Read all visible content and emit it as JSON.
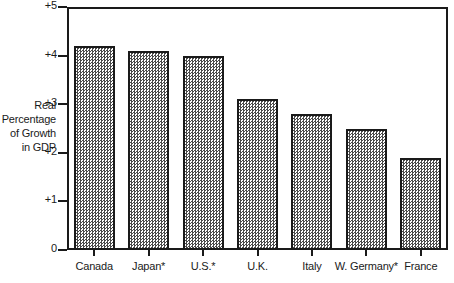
{
  "chart_data": {
    "type": "bar",
    "title": "",
    "subtitle": "",
    "xlabel": "",
    "ylabel": "Real Percentage of Growth in GDP",
    "ylabel_lines": [
      "Real",
      "Percentage",
      "of Growth",
      "in GDP"
    ],
    "categories": [
      "Canada",
      "Japan*",
      "U.S.*",
      "U.K.",
      "Italy",
      "W. Germany*",
      "France"
    ],
    "values": [
      4.2,
      4.1,
      4.0,
      3.1,
      2.8,
      2.5,
      1.9
    ],
    "ylim": [
      0,
      5
    ],
    "ytick_values": [
      0,
      1,
      2,
      3,
      4,
      5
    ],
    "ytick_labels": [
      "0",
      "+1",
      "+2",
      "+3",
      "+4",
      "+5"
    ],
    "grid": false,
    "legend": null,
    "legend_position": "none",
    "bar_fill": "#4a4a4a",
    "bar_fill_style": "checkerboard-dither",
    "bar_border_color": "#1a1a1a",
    "frame_color": "#1a1a1a",
    "background": "#ffffff"
  }
}
